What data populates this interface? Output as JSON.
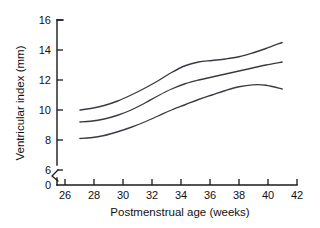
{
  "chart_data": {
    "type": "line",
    "title": "",
    "subtitle": "",
    "xlabel": "Postmenstrual age (weeks)",
    "ylabel": "Ventricular index (mm)",
    "xlim": [
      25.0,
      42.8
    ],
    "ylim": [
      6.0,
      16.0
    ],
    "y_axis_break": true,
    "y_break_between": [
      0,
      6
    ],
    "grid": false,
    "legend": null,
    "legend_position": "none",
    "xticks": [
      26,
      28,
      30,
      32,
      34,
      36,
      38,
      40,
      42
    ],
    "xtick_labels": [
      "26",
      "28",
      "30",
      "32",
      "34",
      "36",
      "38",
      "40",
      "42"
    ],
    "yticks": [
      0,
      6,
      8,
      10,
      12,
      14,
      16
    ],
    "ytick_labels": [
      "0",
      "6",
      "8",
      "10",
      "12",
      "14",
      "16"
    ],
    "x": [
      26.7,
      27.5,
      28.5,
      29.5,
      30.5,
      31.5,
      32.5,
      33.5,
      34.5,
      35.5,
      36.5,
      37.5,
      38.5,
      39.5,
      40.5,
      41.7
    ],
    "series": [
      {
        "name": "upper centile",
        "color": "#3a3a42",
        "values": [
          10.0,
          10.1,
          10.3,
          10.6,
          11.0,
          11.45,
          11.95,
          12.5,
          12.95,
          13.2,
          13.3,
          13.4,
          13.55,
          13.8,
          14.1,
          14.5
        ]
      },
      {
        "name": "median",
        "color": "#3a3a42",
        "values": [
          9.2,
          9.25,
          9.4,
          9.65,
          10.0,
          10.45,
          10.95,
          11.4,
          11.75,
          12.0,
          12.2,
          12.4,
          12.6,
          12.8,
          13.0,
          13.2
        ]
      },
      {
        "name": "lower centile",
        "color": "#3a3a42",
        "values": [
          8.1,
          8.15,
          8.3,
          8.55,
          8.85,
          9.2,
          9.6,
          10.0,
          10.35,
          10.7,
          11.0,
          11.3,
          11.55,
          11.68,
          11.65,
          11.4
        ]
      }
    ]
  },
  "figure": {
    "background_color": "#ffffff",
    "line_color": "#3a3a42",
    "axis_color": "#1a1a1a"
  }
}
